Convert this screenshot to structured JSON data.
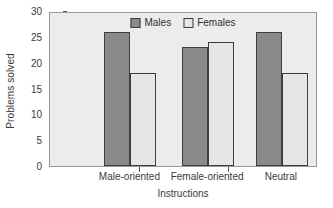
{
  "chart_data": {
    "type": "bar",
    "title": "",
    "xlabel": "Instructions",
    "ylabel": "Problems solved",
    "categories": [
      "Male-oriented",
      "Female-oriented",
      "Neutral"
    ],
    "series": [
      {
        "name": "Males",
        "values": [
          26,
          23,
          26
        ],
        "color": "#8a8a8a"
      },
      {
        "name": "Females",
        "values": [
          18,
          24,
          18
        ],
        "color": "#e6e6e6"
      }
    ],
    "ylim": [
      0,
      30
    ],
    "yticks": [
      0,
      5,
      10,
      15,
      20,
      25,
      30
    ],
    "grid": false,
    "legend_position": "top-center-inside",
    "plot_background": "#ececec"
  }
}
